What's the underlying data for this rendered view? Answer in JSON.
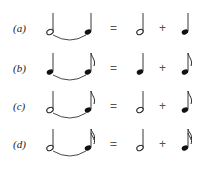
{
  "rows": [
    {
      "label": "(a)",
      "tied": [
        "half",
        "quarter"
      ],
      "equals": "=",
      "plus": "+",
      "parts": [
        "half",
        "quarter"
      ]
    },
    {
      "label": "(b)",
      "tied": [
        "quarter",
        "eighth"
      ],
      "equals": "=",
      "plus": "+",
      "parts": [
        "quarter",
        "eighth"
      ]
    },
    {
      "label": "(c)",
      "tied": [
        "half",
        "eighth"
      ],
      "equals": "=",
      "plus": "+",
      "parts": [
        "half",
        "eighth"
      ]
    },
    {
      "label": "(d)",
      "tied": [
        "half",
        "sixteenth"
      ],
      "equals": "=",
      "plus": "+",
      "parts": [
        "half",
        "sixteenth"
      ]
    }
  ]
}
